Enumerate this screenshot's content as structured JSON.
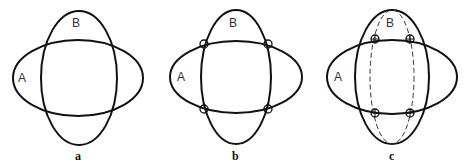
{
  "figure": {
    "panels": [
      {
        "id": "a",
        "caption": "a",
        "labels": {
          "A": "A",
          "B": "B"
        },
        "ellipse_A": {
          "cx": 78,
          "cy": 78,
          "rx": 65,
          "ry": 38
        },
        "ellipse_B": {
          "cx": 79,
          "cy": 78,
          "rx": 38,
          "ry": 67
        },
        "intersection_markers": [],
        "dashed_ellipse": null
      },
      {
        "id": "b",
        "caption": "b",
        "labels": {
          "A": "A",
          "B": "B"
        },
        "ellipse_A": {
          "cx": 236,
          "cy": 77,
          "rx": 66,
          "ry": 36
        },
        "ellipse_B": {
          "cx": 236,
          "cy": 77,
          "rx": 35,
          "ry": 67
        },
        "intersection_markers": [
          {
            "x": 204,
            "y": 44,
            "style": "circle"
          },
          {
            "x": 268,
            "y": 44,
            "style": "circle"
          },
          {
            "x": 204,
            "y": 109,
            "style": "circle"
          },
          {
            "x": 268,
            "y": 109,
            "style": "circle"
          }
        ],
        "dashed_ellipse": null
      },
      {
        "id": "c",
        "caption": "c",
        "labels": {
          "A": "A",
          "B": "B"
        },
        "ellipse_A": {
          "cx": 392,
          "cy": 77,
          "rx": 65,
          "ry": 37
        },
        "ellipse_B": {
          "cx": 392,
          "cy": 77,
          "rx": 37,
          "ry": 67
        },
        "intersection_markers": [
          {
            "x": 375,
            "y": 39,
            "style": "crossed-circle"
          },
          {
            "x": 410,
            "y": 39,
            "style": "crossed-circle"
          },
          {
            "x": 375,
            "y": 113,
            "style": "crossed-circle"
          },
          {
            "x": 410,
            "y": 113,
            "style": "crossed-circle"
          }
        ],
        "dashed_ellipse": {
          "cx": 392,
          "cy": 77,
          "rx": 22,
          "ry": 67
        }
      }
    ]
  }
}
